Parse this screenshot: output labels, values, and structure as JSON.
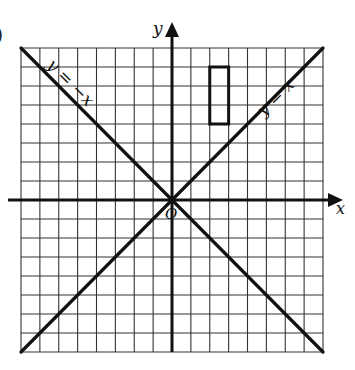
{
  "figure": {
    "partial_label": ")",
    "axes": {
      "x_label": "x",
      "y_label": "y",
      "origin_label": "O",
      "x_range": [
        -8,
        8
      ],
      "y_range": [
        -8,
        8
      ],
      "grid_step": 1
    },
    "lines": [
      {
        "equation": "y = x",
        "label": "y = x",
        "slope": 1
      },
      {
        "equation": "y = -x",
        "label": "y = −x",
        "slope": -1
      }
    ],
    "shapes": [
      {
        "type": "rectangle",
        "x_min": 2,
        "x_max": 3,
        "y_min": 4,
        "y_max": 7
      }
    ],
    "colors": {
      "ink": "#111111",
      "grid": "#333333",
      "background": "#ffffff"
    }
  }
}
